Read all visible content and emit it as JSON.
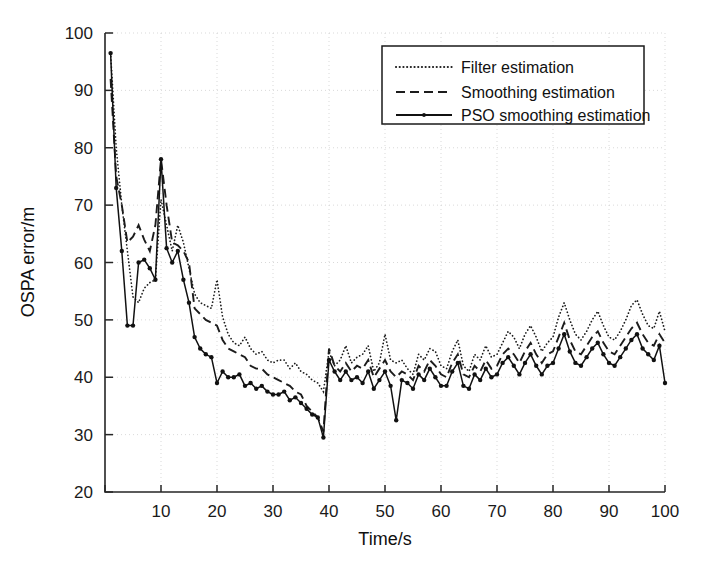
{
  "figure": {
    "background_color": "#ffffff",
    "ink_color": "#1a1a1a",
    "grid_color": "#c9c9c9"
  },
  "axes": {
    "x_title": "Time/s",
    "y_title": "OSPA error/m",
    "x_ticks": [
      "0",
      "10",
      "20",
      "30",
      "40",
      "50",
      "60",
      "70",
      "80",
      "90",
      "100"
    ],
    "y_ticks": [
      "20",
      "30",
      "40",
      "50",
      "60",
      "70",
      "80",
      "90",
      "100"
    ]
  },
  "legend": {
    "position": "top-right",
    "items": [
      {
        "label": "Filter estimation",
        "style": "dotted"
      },
      {
        "label": "Smoothing estimation",
        "style": "dashed"
      },
      {
        "label": "PSO smoothing estimation",
        "style": "solid-marker"
      }
    ]
  },
  "chart_data": {
    "type": "line",
    "title": "",
    "xlabel": "Time/s",
    "ylabel": "OSPA error/m",
    "xlim": [
      0,
      100
    ],
    "ylim": [
      20,
      100
    ],
    "xticks": [
      0,
      10,
      20,
      30,
      40,
      50,
      60,
      70,
      80,
      90,
      100
    ],
    "yticks": [
      20,
      30,
      40,
      50,
      60,
      70,
      80,
      90,
      100
    ],
    "grid": true,
    "legend_position": "upper right",
    "x": [
      1,
      2,
      3,
      4,
      5,
      6,
      7,
      8,
      9,
      10,
      11,
      12,
      13,
      14,
      15,
      16,
      17,
      18,
      19,
      20,
      21,
      22,
      23,
      24,
      25,
      26,
      27,
      28,
      29,
      30,
      31,
      32,
      33,
      34,
      35,
      36,
      37,
      38,
      39,
      40,
      41,
      42,
      43,
      44,
      45,
      46,
      47,
      48,
      49,
      50,
      51,
      52,
      53,
      54,
      55,
      56,
      57,
      58,
      59,
      60,
      61,
      62,
      63,
      64,
      65,
      66,
      67,
      68,
      69,
      70,
      71,
      72,
      73,
      74,
      75,
      76,
      77,
      78,
      79,
      80,
      81,
      82,
      83,
      84,
      85,
      86,
      87,
      88,
      89,
      90,
      91,
      92,
      93,
      94,
      95,
      96,
      97,
      98,
      99,
      100
    ],
    "series": [
      {
        "name": "Filter estimation",
        "style": "dotted",
        "color": "#1c1c1c",
        "values": [
          96.5,
          80.0,
          70.0,
          62.0,
          54.0,
          53.0,
          55.5,
          56.5,
          57.0,
          71.0,
          66.5,
          62.0,
          66.5,
          63.5,
          59.0,
          54.5,
          53.0,
          52.5,
          52.0,
          57.0,
          50.5,
          47.5,
          46.0,
          45.5,
          47.0,
          45.0,
          44.0,
          44.5,
          43.0,
          42.5,
          43.0,
          43.0,
          41.5,
          42.5,
          41.0,
          40.5,
          39.5,
          39.0,
          37.5,
          44.5,
          42.0,
          43.0,
          45.5,
          42.5,
          43.5,
          44.0,
          45.5,
          41.0,
          42.5,
          47.5,
          43.0,
          42.5,
          43.0,
          41.5,
          40.5,
          44.0,
          43.0,
          45.0,
          44.5,
          42.0,
          41.5,
          44.5,
          46.5,
          42.0,
          41.0,
          44.0,
          43.0,
          45.5,
          43.5,
          44.0,
          46.0,
          48.0,
          47.0,
          45.0,
          47.5,
          49.0,
          47.0,
          44.5,
          46.0,
          47.0,
          50.5,
          53.0,
          50.0,
          47.5,
          46.5,
          48.0,
          50.0,
          51.5,
          49.0,
          47.0,
          46.5,
          48.0,
          50.0,
          52.5,
          53.5,
          51.0,
          49.0,
          48.5,
          51.5,
          48.0
        ]
      },
      {
        "name": "Smoothing estimation",
        "style": "dashed",
        "color": "#1c1c1c",
        "values": [
          92.0,
          75.0,
          70.0,
          63.5,
          64.5,
          66.5,
          64.0,
          62.0,
          66.5,
          78.0,
          70.0,
          63.5,
          63.0,
          62.0,
          60.0,
          52.0,
          51.0,
          50.0,
          49.5,
          49.0,
          46.5,
          45.0,
          44.5,
          44.0,
          43.5,
          42.0,
          41.5,
          41.5,
          40.5,
          40.0,
          39.5,
          39.0,
          38.5,
          37.5,
          37.0,
          35.0,
          34.0,
          33.0,
          30.5,
          45.0,
          42.0,
          41.0,
          42.5,
          41.0,
          42.0,
          41.5,
          43.0,
          40.0,
          41.5,
          43.0,
          41.0,
          40.0,
          41.0,
          40.5,
          39.5,
          42.0,
          41.0,
          43.0,
          42.0,
          40.5,
          40.0,
          42.5,
          44.0,
          40.5,
          40.0,
          42.0,
          41.0,
          43.0,
          41.5,
          42.0,
          44.0,
          45.0,
          44.0,
          42.5,
          44.5,
          46.0,
          44.0,
          42.5,
          44.0,
          44.5,
          47.0,
          49.5,
          46.5,
          44.5,
          44.0,
          45.5,
          47.0,
          48.0,
          46.0,
          44.5,
          44.0,
          45.5,
          47.0,
          48.5,
          49.5,
          47.5,
          46.0,
          45.5,
          47.5,
          46.0
        ]
      },
      {
        "name": "PSO smoothing estimation",
        "style": "solid-marker",
        "color": "#111111",
        "values": [
          96.5,
          73.0,
          62.0,
          49.0,
          49.0,
          60.0,
          60.5,
          59.0,
          57.0,
          78.0,
          62.5,
          60.0,
          62.0,
          57.0,
          53.0,
          47.0,
          45.0,
          44.0,
          43.5,
          39.0,
          41.0,
          40.0,
          40.0,
          40.5,
          38.5,
          39.0,
          38.0,
          38.5,
          37.5,
          37.0,
          37.0,
          37.5,
          36.0,
          36.5,
          35.5,
          34.5,
          33.5,
          33.0,
          29.5,
          43.0,
          41.0,
          39.5,
          41.0,
          39.5,
          40.0,
          39.0,
          41.0,
          38.0,
          39.5,
          41.0,
          38.5,
          32.5,
          39.5,
          39.0,
          38.0,
          40.5,
          39.5,
          41.5,
          40.0,
          38.5,
          38.5,
          41.0,
          42.5,
          38.5,
          38.0,
          40.5,
          39.5,
          41.5,
          40.0,
          40.5,
          42.5,
          43.5,
          42.0,
          40.5,
          42.5,
          44.0,
          42.0,
          40.5,
          42.0,
          42.5,
          45.0,
          47.5,
          44.5,
          42.5,
          42.0,
          43.5,
          45.0,
          46.0,
          44.0,
          42.5,
          42.0,
          43.5,
          45.0,
          46.5,
          47.5,
          45.0,
          44.0,
          43.0,
          45.5,
          39.0
        ]
      }
    ]
  }
}
